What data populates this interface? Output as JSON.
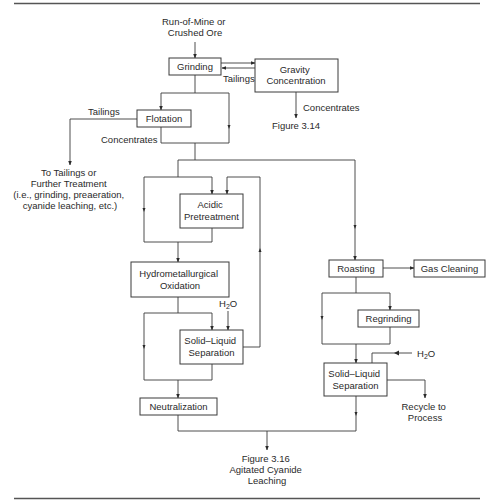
{
  "diagram": {
    "inputs": {
      "feed": [
        "Run-of-Mine or",
        "Crushed Ore"
      ]
    },
    "boxes": {
      "grinding": [
        "Grinding"
      ],
      "gravity": [
        "Gravity",
        "Concentration"
      ],
      "flotation": [
        "Flotation"
      ],
      "acidic": [
        "Acidic",
        "Pretreatment"
      ],
      "hydro": [
        "Hydrometallurgical",
        "Oxidation"
      ],
      "sls_left": [
        "Solid–Liquid",
        "Separation"
      ],
      "neutralization": [
        "Neutralization"
      ],
      "roasting": [
        "Roasting"
      ],
      "gas_cleaning": [
        "Gas Cleaning"
      ],
      "regrinding": [
        "Regrinding"
      ],
      "sls_right": [
        "Solid–Liquid",
        "Separation"
      ]
    },
    "labels": {
      "tailings_gravity": "Tailings",
      "concentrates_gravity": "Concentrates",
      "figure_314": "Figure 3.14",
      "tailings_flotation": "Tailings",
      "concentrates_flotation": "Concentrates",
      "to_tailings": [
        "To Tailings or",
        "Further Treatment",
        "(i.e., grinding, preaeration,",
        "cyanide leaching, etc.)"
      ],
      "h2o_left": "H",
      "h2o_left_sub": "2",
      "h2o_left_o": "O",
      "h2o_right": "H",
      "h2o_right_sub": "2",
      "h2o_right_o": "O",
      "recycle": [
        "Recycle to",
        "Process"
      ],
      "figure_316": [
        "Figure 3.16",
        "Agitated Cyanide",
        "Leaching"
      ]
    }
  }
}
